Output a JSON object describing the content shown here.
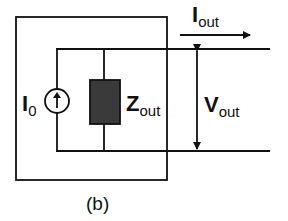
{
  "diagram": {
    "type": "circuit-schematic",
    "caption": "(b)",
    "components": [
      {
        "id": "current-source",
        "label_main": "I",
        "label_sub": "0",
        "symbol": "circle-with-up-arrow"
      },
      {
        "id": "output-impedance",
        "label_main": "Z",
        "label_sub": "out",
        "symbol": "filled-rectangle"
      }
    ],
    "quantities": [
      {
        "id": "output-current",
        "label_main": "I",
        "label_sub": "out",
        "symbol": "right-arrow"
      },
      {
        "id": "output-voltage",
        "label_main": "V",
        "label_sub": "out",
        "symbol": "double-headed-vertical-arrow"
      }
    ],
    "colors": {
      "line": "#111111",
      "impedance_fill": "#3a3a3a",
      "background": "#ffffff"
    }
  }
}
